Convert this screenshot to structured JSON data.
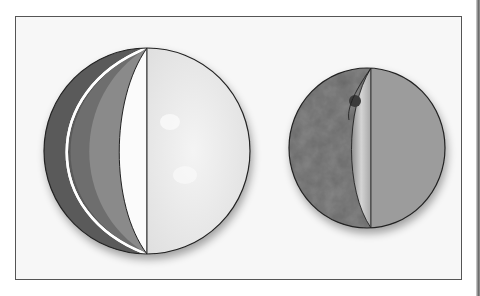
{
  "figure": {
    "frame": {
      "border_color": "#555555",
      "background": "#f7f7f7"
    },
    "globes": [
      {
        "id": "large-globe",
        "center": [
          147,
          151
        ],
        "radius": 103,
        "layers": [
          {
            "name": "outer-layer",
            "color": "#5a5a5a"
          },
          {
            "name": "white-boundary",
            "color": "#ffffff"
          },
          {
            "name": "middle-layer",
            "color": "#6e6e6e"
          },
          {
            "name": "inner-layer",
            "color": "#8a8a8a"
          },
          {
            "name": "cut-face",
            "color": "#fbfbfb"
          },
          {
            "name": "surface-hemisphere",
            "color": "#e9e9e9"
          }
        ]
      },
      {
        "id": "small-globe",
        "center": [
          367,
          148
        ],
        "radius": [
          78,
          80
        ],
        "layers": [
          {
            "name": "mottled-interior",
            "color": "#676767"
          },
          {
            "name": "cut-face",
            "color": "#b9b9b9"
          },
          {
            "name": "surface-hemisphere",
            "color": "#9a9a9a"
          },
          {
            "name": "small-core-blob",
            "color": "#3a3a3a"
          }
        ]
      }
    ]
  }
}
